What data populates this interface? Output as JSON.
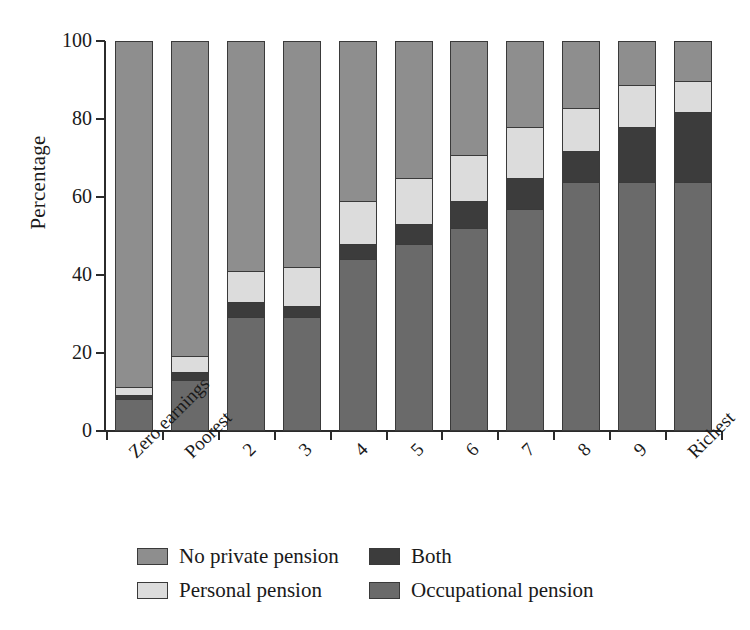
{
  "chart_data": {
    "type": "bar",
    "subtype": "stacked-bar-100-percent",
    "title": "",
    "xlabel": "",
    "ylabel": "Percentage",
    "ylim": [
      0,
      100
    ],
    "yticks": [
      0,
      20,
      40,
      60,
      80,
      100
    ],
    "ytick_labels": [
      "0",
      "20",
      "40",
      "60",
      "80",
      "100"
    ],
    "grid": false,
    "legend_position": "bottom",
    "categories": [
      "Zero earnings",
      "Poorest",
      "2",
      "3",
      "4",
      "5",
      "6",
      "7",
      "8",
      "9",
      "Richest"
    ],
    "series": [
      {
        "name": "Occupational pension",
        "color": "#6a6a6a",
        "values": [
          8,
          13,
          29,
          29,
          44,
          48,
          52,
          57,
          64,
          64,
          64
        ]
      },
      {
        "name": "Both",
        "color": "#3c3c3c",
        "values": [
          1,
          2,
          4,
          3,
          4,
          5,
          7,
          8,
          8,
          14,
          18
        ]
      },
      {
        "name": "Personal pension",
        "color": "#dcdcdc",
        "values": [
          2,
          4,
          8,
          10,
          11,
          12,
          12,
          13,
          11,
          11,
          8
        ]
      },
      {
        "name": "No private pension",
        "color": "#8e8e8e",
        "values": [
          89,
          81,
          59,
          58,
          41,
          35,
          29,
          22,
          17,
          11,
          10
        ]
      }
    ],
    "stack_order_bottom_to_top": [
      "Occupational pension",
      "Both",
      "Personal pension",
      "No private pension"
    ]
  },
  "legend": {
    "items": [
      {
        "label": "No private pension",
        "swatch": "#8e8e8e"
      },
      {
        "label": "Both",
        "swatch": "#3c3c3c"
      },
      {
        "label": "Personal pension",
        "swatch": "#dcdcdc"
      },
      {
        "label": "Occupational pension",
        "swatch": "#6a6a6a"
      }
    ]
  },
  "colors": {
    "axis": "#2b2b2b",
    "text": "#1a1a1a",
    "background": "#ffffff"
  }
}
